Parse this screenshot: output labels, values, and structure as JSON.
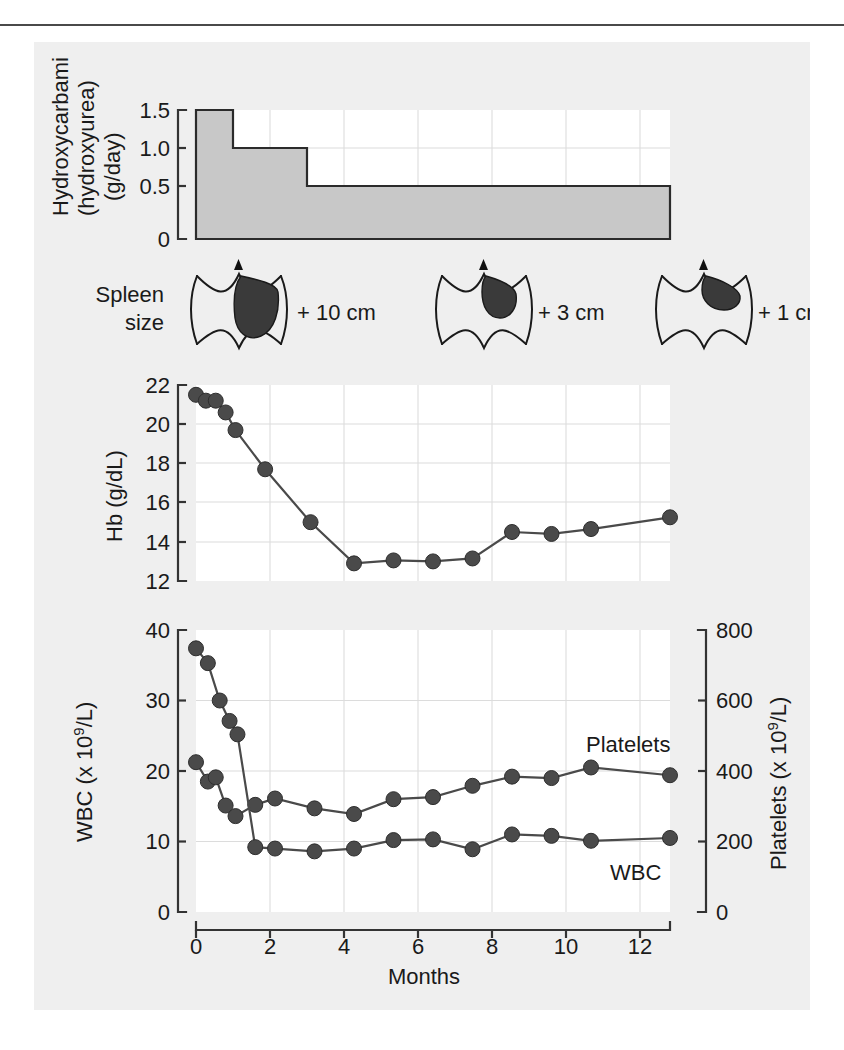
{
  "figure": {
    "background_color": "#efefef",
    "panels": [
      "dose-panel",
      "spleen-panel",
      "hb-panel",
      "counts-panel"
    ]
  },
  "dose_panel": {
    "axis_title_line1": "Hydroxycarbamide",
    "axis_title_line2": "(hydroxyurea)",
    "axis_title_line3": "(g/day)",
    "y_ticks": [
      "1.5",
      "1.0",
      "0.5",
      "0"
    ]
  },
  "spleen_panel": {
    "label_line1": "Spleen",
    "label_line2": "size",
    "measurements": [
      "+ 10 cm",
      "+ 3 cm",
      "+ 1 cm"
    ]
  },
  "hb_panel": {
    "axis_title": "Hb (g/dL)",
    "y_ticks": [
      "22",
      "20",
      "18",
      "16",
      "14",
      "12"
    ]
  },
  "counts_panel": {
    "left_axis_title_parts": [
      "WBC (x 10",
      "9",
      "/L)"
    ],
    "right_axis_title_parts": [
      "Platelets (x 10",
      "9",
      "/L)"
    ],
    "left_y_ticks": [
      "40",
      "30",
      "20",
      "10",
      "0"
    ],
    "right_y_ticks": [
      "800",
      "600",
      "400",
      "200",
      "0"
    ],
    "series_label_platelets": "Platelets",
    "series_label_wbc": "WBC"
  },
  "x_axis": {
    "title": "Months",
    "ticks": [
      "0",
      "2",
      "4",
      "6",
      "8",
      "10",
      "12"
    ]
  },
  "chart_data": [
    {
      "type": "area",
      "name": "hydroxycarbamide-dose",
      "title": "Hydroxycarbamide (hydroxyurea) (g/day)",
      "xlabel": "Months",
      "ylabel": "Hydroxycarbamide (hydroxyurea) (g/day)",
      "xlim": [
        0,
        12
      ],
      "ylim": [
        0,
        1.6
      ],
      "yticks": [
        0,
        0.5,
        1.0,
        1.5
      ],
      "grid": true,
      "step_segments": [
        {
          "x_start": 0,
          "x_end": 1.0,
          "dose": 1.5
        },
        {
          "x_start": 1.0,
          "x_end": 3.0,
          "dose": 1.0
        },
        {
          "x_start": 3.0,
          "x_end": 12.0,
          "dose": 0.5
        }
      ]
    },
    {
      "type": "table",
      "name": "spleen-size",
      "title": "Spleen size",
      "categories": [
        "month ~0.1",
        "month ~5.0",
        "month ~10.0"
      ],
      "values": [
        "+ 10 cm",
        "+ 3 cm",
        "+ 1 cm"
      ],
      "x_positions": [
        0.1,
        5.0,
        10.0
      ]
    },
    {
      "type": "line",
      "name": "haemoglobin",
      "title": "Hb (g/dL)",
      "xlabel": "Months",
      "ylabel": "Hb (g/dL)",
      "xlim": [
        0,
        12
      ],
      "ylim": [
        12,
        22
      ],
      "yticks": [
        12,
        14,
        16,
        18,
        20,
        22
      ],
      "grid": true,
      "series": [
        {
          "name": "Hb",
          "x": [
            0.0,
            0.25,
            0.5,
            0.75,
            1.0,
            1.75,
            2.9,
            4.0,
            5.0,
            6.0,
            7.0,
            8.0,
            9.0,
            10.0,
            12.0
          ],
          "values": [
            21.5,
            21.2,
            21.2,
            20.6,
            19.7,
            17.7,
            15.0,
            12.9,
            13.05,
            13.0,
            13.15,
            14.5,
            14.4,
            14.65,
            15.25
          ]
        }
      ]
    },
    {
      "type": "line",
      "name": "blood-counts",
      "title": "WBC and Platelets over time",
      "xlabel": "Months",
      "ylabel": "WBC (x 10^9/L)",
      "ylabel_right": "Platelets (x 10^9/L)",
      "xlim": [
        0,
        12
      ],
      "ylim": [
        0,
        40
      ],
      "ylim_right": [
        0,
        800
      ],
      "yticks": [
        0,
        10,
        20,
        30,
        40
      ],
      "yticks_right": [
        0,
        200,
        400,
        600,
        800
      ],
      "grid": true,
      "legend_position": "inline-right",
      "series": [
        {
          "name": "WBC",
          "unit": "x 10^9/L",
          "axis": "left",
          "x": [
            0.0,
            0.3,
            0.6,
            0.85,
            1.05,
            1.5,
            2.0,
            3.0,
            4.0,
            5.0,
            6.0,
            7.0,
            8.0,
            9.0,
            10.0,
            12.0
          ],
          "values": [
            37.4,
            35.3,
            30.0,
            27.1,
            25.2,
            9.2,
            9.0,
            8.6,
            9.0,
            10.2,
            10.3,
            8.9,
            11.0,
            10.8,
            10.1,
            10.5
          ]
        },
        {
          "name": "Platelets",
          "unit": "x 10^9/L",
          "axis": "right",
          "x": [
            0.0,
            0.3,
            0.5,
            0.75,
            1.0,
            1.5,
            2.0,
            3.0,
            4.0,
            5.0,
            6.0,
            7.0,
            8.0,
            9.0,
            10.0,
            12.0
          ],
          "values": [
            425,
            370,
            382,
            302,
            272,
            304,
            322,
            294,
            278,
            320,
            326,
            358,
            384,
            380,
            410,
            388
          ]
        }
      ]
    }
  ]
}
